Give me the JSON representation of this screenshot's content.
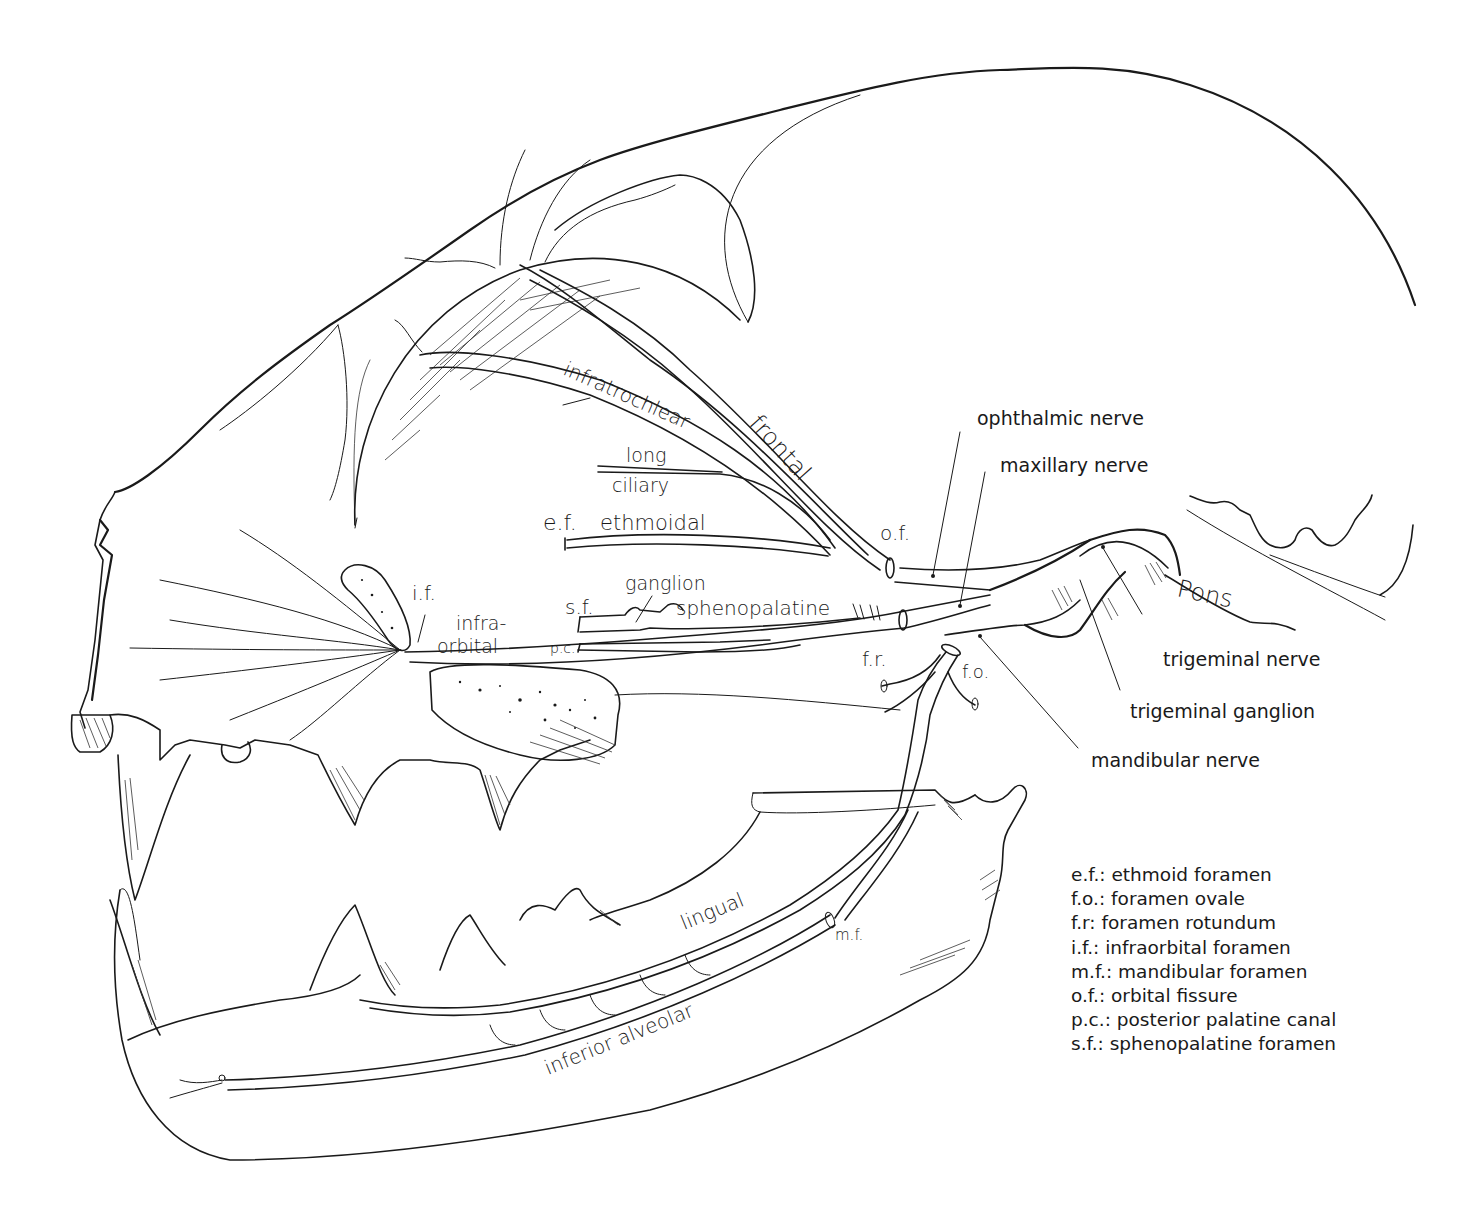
{
  "figure": {
    "callouts": {
      "ophthalmic_nerve": "ophthalmic nerve",
      "maxillary_nerve": "maxillary nerve",
      "trigeminal_nerve": "trigeminal nerve",
      "trigeminal_ganglion": "trigeminal ganglion",
      "mandibular_nerve": "mandibular nerve"
    },
    "nerve_labels": {
      "infratrochlear": "infratrochlear",
      "frontal": "frontal",
      "long": "long",
      "ciliary": "ciliary",
      "ethmoidal": "ethmoidal",
      "ganglion": "ganglion",
      "sphenopalatine": "sphenopalatine",
      "infra": "infra-",
      "orbital": "orbital",
      "pons": "Pons",
      "lingual": "lingual",
      "inferior_alveolar": "inferior alveolar"
    },
    "abbreviation_marks": {
      "ef": "e.f.",
      "of": "o.f.",
      "if": "i.f.",
      "sf": "s.f.",
      "pc": "p.c.",
      "fr": "f.r.",
      "fo": "f.o.",
      "mf": "m.f."
    }
  },
  "legend": {
    "items": [
      {
        "abbr": "e.f.:",
        "text": "ethmoid foramen"
      },
      {
        "abbr": "f.o.:",
        "text": "foramen ovale"
      },
      {
        "abbr": "f.r:",
        "text": "foramen rotundum"
      },
      {
        "abbr": "i.f.:",
        "text": "infraorbital foramen"
      },
      {
        "abbr": "m.f.:",
        "text": "mandibular foramen"
      },
      {
        "abbr": "o.f.:",
        "text": "orbital fissure"
      },
      {
        "abbr": "p.c.:",
        "text": "posterior palatine canal"
      },
      {
        "abbr": "s.f.:",
        "text": "sphenopalatine foramen"
      }
    ]
  },
  "colors": {
    "ink": "#1a1a1a",
    "paper": "#ffffff"
  }
}
